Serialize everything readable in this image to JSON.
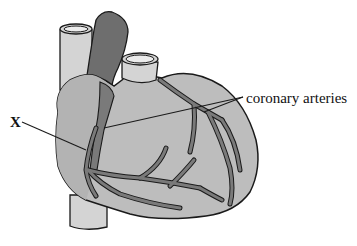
{
  "diagram": {
    "labels": {
      "x": "X",
      "coronary_arteries": "coronary arteries"
    },
    "colors": {
      "heart_fill": "#bdbdbd",
      "heart_shadow": "#a9a9a9",
      "vessel_light": "#d4d4d4",
      "pulmonary_dark": "#6e6e6e",
      "artery_fill": "#7a7a7a",
      "outline": "#1a1a1a",
      "background": "#ffffff"
    },
    "structures": [
      "vena cava (superior)",
      "pulmonary artery",
      "aorta",
      "right atrium",
      "ventricles",
      "coronary arteries",
      "inferior vena cava"
    ]
  }
}
